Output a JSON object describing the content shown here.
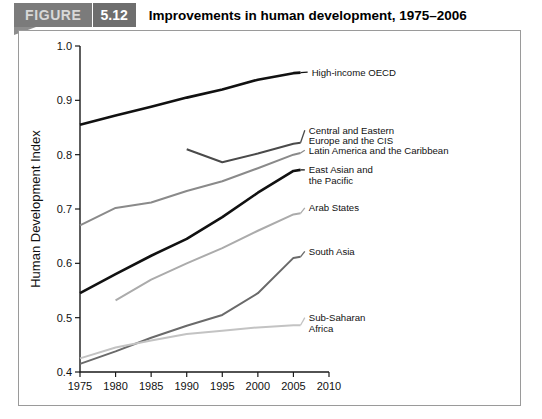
{
  "banner": {
    "figure_label": "FIGURE",
    "figure_number": "5.12",
    "title": "Improvements in human development, 1975–2006"
  },
  "chart_data": {
    "type": "line",
    "title": "Improvements in human development, 1975–2006",
    "xlabel": "",
    "ylabel": "Human Development Index",
    "xlim": [
      1975,
      2010
    ],
    "ylim": [
      0.4,
      1.0
    ],
    "xticks": [
      1975,
      1980,
      1985,
      1990,
      1995,
      2000,
      2005,
      2010
    ],
    "xtick_labels": [
      "1975",
      "1980",
      "1985",
      "1990",
      "1995",
      "2000",
      "2005",
      "2010"
    ],
    "yticks": [
      0.4,
      0.5,
      0.6,
      0.7,
      0.8,
      0.9,
      1.0
    ],
    "ytick_labels": [
      "0.4",
      "0.5",
      "0.6",
      "0.7",
      "0.8",
      "0.9",
      "1.0"
    ],
    "grid": false,
    "legend_position": "right-inline-labels",
    "series": [
      {
        "name": "High-income OECD",
        "label": "High-income OECD",
        "color": "#111111",
        "width": 2.6,
        "label_lines": [
          "High-income OECD"
        ],
        "label_x": 2007.0,
        "label_y": 0.952,
        "x": [
          1975,
          1980,
          1985,
          1990,
          1995,
          2000,
          2005,
          2006
        ],
        "y": [
          0.855,
          0.872,
          0.888,
          0.905,
          0.92,
          0.938,
          0.95,
          0.951
        ]
      },
      {
        "name": "Central and Eastern Europe and the CIS",
        "label": "Central and Eastern Europe and the CIS",
        "color": "#4a4a4a",
        "width": 2.0,
        "label_lines": [
          "Central and Eastern",
          "Europe and the CIS"
        ],
        "label_x": 2006.6,
        "label_y": 0.845,
        "x": [
          1990,
          1995,
          2000,
          2005,
          2006
        ],
        "y": [
          0.81,
          0.786,
          0.802,
          0.82,
          0.822
        ]
      },
      {
        "name": "Latin America and the Caribbean",
        "label": "Latin America and the Caribbean",
        "color": "#8a8a8a",
        "width": 2.0,
        "label_lines": [
          "Latin America and the Caribbean"
        ],
        "label_x": 2006.6,
        "label_y": 0.808,
        "x": [
          1975,
          1980,
          1985,
          1990,
          1995,
          2000,
          2005,
          2006
        ],
        "y": [
          0.67,
          0.702,
          0.712,
          0.733,
          0.751,
          0.775,
          0.8,
          0.803
        ]
      },
      {
        "name": "East Asian and the Pacific",
        "label": "East Asian and the Pacific",
        "color": "#111111",
        "width": 2.6,
        "label_lines": [
          "East Asian and",
          "the Pacific"
        ],
        "label_x": 2006.6,
        "label_y": 0.772,
        "x": [
          1975,
          1980,
          1985,
          1990,
          1995,
          2000,
          2005,
          2006
        ],
        "y": [
          0.545,
          0.58,
          0.614,
          0.645,
          0.685,
          0.73,
          0.77,
          0.772
        ]
      },
      {
        "name": "Arab States",
        "label": "Arab States",
        "color": "#ababab",
        "width": 2.0,
        "label_lines": [
          "Arab States"
        ],
        "label_x": 2006.6,
        "label_y": 0.702,
        "x": [
          1980,
          1985,
          1990,
          1995,
          2000,
          2005,
          2006
        ],
        "y": [
          0.532,
          0.57,
          0.6,
          0.628,
          0.66,
          0.69,
          0.692
        ]
      },
      {
        "name": "South Asia",
        "label": "South Asia",
        "color": "#6a6a6a",
        "width": 2.0,
        "label_lines": [
          "South Asia"
        ],
        "label_x": 2006.6,
        "label_y": 0.622,
        "x": [
          1975,
          1980,
          1985,
          1990,
          1995,
          2000,
          2005,
          2006
        ],
        "y": [
          0.415,
          0.438,
          0.463,
          0.485,
          0.505,
          0.545,
          0.61,
          0.612
        ]
      },
      {
        "name": "Sub-Saharan Africa",
        "label": "Sub-Saharan Africa",
        "color": "#c3c3c3",
        "width": 2.0,
        "label_lines": [
          "Sub-Saharan",
          "Africa"
        ],
        "label_x": 2006.6,
        "label_y": 0.5,
        "x": [
          1975,
          1980,
          1985,
          1990,
          1995,
          2000,
          2005,
          2006
        ],
        "y": [
          0.425,
          0.445,
          0.458,
          0.47,
          0.476,
          0.482,
          0.486,
          0.486
        ]
      }
    ]
  }
}
